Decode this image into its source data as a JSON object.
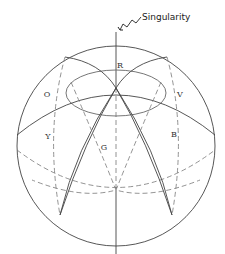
{
  "annotation": {
    "text": "Singularity",
    "arrow": "zigzag-arrow pointing to top of vertical axis"
  },
  "region_labels": [
    {
      "id": "R",
      "text": "R",
      "x": 116,
      "y": 66
    },
    {
      "id": "O",
      "text": "O",
      "x": 48,
      "y": 95
    },
    {
      "id": "V",
      "text": "V",
      "x": 180,
      "y": 95
    },
    {
      "id": "Y",
      "text": "Y",
      "x": 48,
      "y": 139
    },
    {
      "id": "G",
      "text": "G",
      "x": 103,
      "y": 148
    },
    {
      "id": "B",
      "text": "B",
      "x": 173,
      "y": 136
    }
  ],
  "colors": {
    "stroke_solid": "#444444",
    "stroke_dashed": "#777777",
    "background": "#ffffff"
  }
}
